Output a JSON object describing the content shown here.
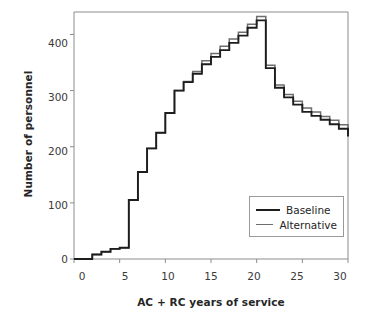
{
  "chart_data": {
    "type": "line",
    "title": "",
    "subtitle": "",
    "xlabel": "AC + RC years of service",
    "ylabel": "Number of personnel",
    "xlim": [
      0,
      30
    ],
    "ylim": [
      0,
      440
    ],
    "xticks": [
      0,
      5,
      10,
      15,
      20,
      25,
      30
    ],
    "yticks": [
      0,
      100,
      200,
      300,
      400
    ],
    "grid": false,
    "drawstyle": "steps-post",
    "legend_position": "lower right",
    "legend": [
      "Baseline",
      "Alternative"
    ],
    "x": [
      0,
      1,
      2,
      3,
      4,
      5,
      6,
      7,
      8,
      9,
      10,
      11,
      12,
      13,
      14,
      15,
      16,
      17,
      18,
      19,
      20,
      21,
      22,
      23,
      24,
      25,
      26,
      27,
      28,
      29,
      30
    ],
    "series": [
      {
        "name": "Baseline",
        "color": "#1d1d1d",
        "values": [
          0,
          0,
          8,
          13,
          18,
          20,
          105,
          155,
          197,
          225,
          260,
          300,
          315,
          330,
          347,
          360,
          372,
          385,
          398,
          412,
          425,
          340,
          305,
          288,
          275,
          262,
          255,
          248,
          240,
          232,
          218
        ]
      },
      {
        "name": "Alternative",
        "color": "#6e6e6e",
        "values": [
          0,
          0,
          8,
          13,
          18,
          20,
          105,
          155,
          197,
          225,
          260,
          300,
          316,
          334,
          353,
          366,
          379,
          392,
          404,
          418,
          432,
          345,
          310,
          293,
          281,
          269,
          262,
          254,
          247,
          239,
          225
        ]
      }
    ],
    "annotations": []
  },
  "axis": {
    "y_tick_labels": [
      "400",
      "300",
      "200",
      "100",
      "0"
    ],
    "x_tick_labels": [
      "0",
      "5",
      "10",
      "15",
      "20",
      "25",
      "30"
    ],
    "y_title": "Number of personnel",
    "x_title": "AC + RC years of service"
  },
  "legend": {
    "items": [
      {
        "label": "Baseline"
      },
      {
        "label": "Alternative"
      }
    ]
  },
  "colors": {
    "baseline": "#1d1d1d",
    "alternative": "#6e6e6e",
    "frame": "#8c8c8c",
    "background": "#ffffff"
  }
}
